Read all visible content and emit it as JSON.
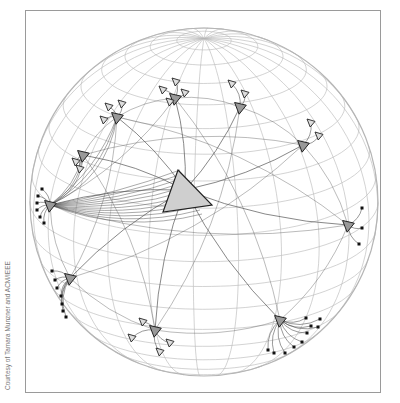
{
  "credit": "Courtesy of Tamara Munzner and ACM/IEEE",
  "colors": {
    "grid": "#b5b5b5",
    "edge": "#555555",
    "node_fill": "#cfcfcf",
    "node_stroke": "#222222",
    "frame": "#9a9a9a"
  },
  "sphere": {
    "cx": 204,
    "cy": 202,
    "r": 174,
    "meridians": 12,
    "parallels": 10
  },
  "root": {
    "x": 185,
    "y": 190,
    "points": "178,170 212,205 163,212"
  },
  "clusters": [
    {
      "name": "left-cluster",
      "hub": [
        50,
        205
      ],
      "leaves": [
        [
          38,
          196
        ],
        [
          37,
          203
        ],
        [
          37,
          210
        ],
        [
          40,
          217
        ],
        [
          42,
          189
        ],
        [
          44,
          223
        ]
      ]
    },
    {
      "name": "lower-left-cluster",
      "hub": [
        70,
        278
      ],
      "leaves": [
        [
          52,
          271
        ],
        [
          55,
          280
        ],
        [
          57,
          288
        ],
        [
          61,
          296
        ],
        [
          62,
          304
        ],
        [
          63,
          311
        ],
        [
          66,
          317
        ]
      ]
    },
    {
      "name": "bottom-cluster",
      "hub": [
        155,
        330
      ],
      "leaves": [
        [
          132,
          338
        ],
        [
          143,
          322
        ],
        [
          170,
          343
        ],
        [
          160,
          352
        ]
      ]
    },
    {
      "name": "lower-right-cluster",
      "hub": [
        280,
        320
      ],
      "leaves": [
        [
          306,
          318
        ],
        [
          311,
          326
        ],
        [
          307,
          333
        ],
        [
          302,
          342
        ],
        [
          294,
          347
        ],
        [
          285,
          353
        ],
        [
          274,
          353
        ],
        [
          268,
          350
        ],
        [
          320,
          319
        ],
        [
          318,
          327
        ]
      ]
    },
    {
      "name": "right-cluster",
      "hub": [
        348,
        225
      ],
      "leaves": [
        [
          362,
          208
        ],
        [
          362,
          228
        ],
        [
          359,
          244
        ]
      ]
    },
    {
      "name": "upper-right-cluster",
      "hub": [
        303,
        145
      ],
      "leaves": [
        [
          311,
          123
        ],
        [
          319,
          136
        ]
      ]
    },
    {
      "name": "top-right-cluster",
      "hub": [
        240,
        107
      ],
      "leaves": [
        [
          232,
          84
        ],
        [
          245,
          94
        ]
      ]
    },
    {
      "name": "top-cluster",
      "hub": [
        175,
        98
      ],
      "leaves": [
        [
          176,
          82
        ],
        [
          163,
          90
        ],
        [
          185,
          93
        ],
        [
          170,
          102
        ]
      ]
    },
    {
      "name": "upper-left-cluster",
      "hub": [
        117,
        117
      ],
      "leaves": [
        [
          109,
          107
        ],
        [
          122,
          104
        ],
        [
          104,
          120
        ]
      ]
    },
    {
      "name": "left-upper-cluster",
      "hub": [
        83,
        155
      ],
      "leaves": [
        [
          80,
          169
        ],
        [
          76,
          162
        ]
      ]
    }
  ]
}
